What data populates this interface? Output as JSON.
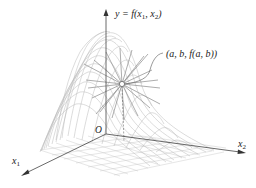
{
  "figure": {
    "type": "3d-surface-with-tangent-lines",
    "y_axis_label": {
      "base": "y = f(x",
      "sub1": "1",
      "mid": ", x",
      "sub2": "2",
      "end": ")"
    },
    "point_label": "(a, b, f(a, b))",
    "origin_label": "O",
    "x1_label": {
      "base": "x",
      "sub": "1"
    },
    "x2_label": {
      "base": "x",
      "sub": "2"
    },
    "colors": {
      "axis": "#444444",
      "mesh": "#b8b8b8",
      "tangent_lines": "#8a8a8a",
      "text": "#222222",
      "background": "#ffffff"
    }
  }
}
